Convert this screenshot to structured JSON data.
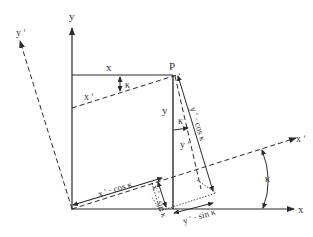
{
  "diagram": {
    "colors": {
      "line": "#2b2b2b",
      "background": "#ffffff"
    },
    "axes": {
      "x": "x",
      "y": "y",
      "x_prime": "x ʹ",
      "y_prime": "y ʹ"
    },
    "point": "P",
    "labels": {
      "x_segment": "x",
      "x_prime_segment": "x ʹ",
      "y_segment": "y",
      "y_prime_segment": "y ʹ",
      "kappa_top": "κ",
      "kappa_mid": "κ",
      "kappa_right": "κ",
      "y_cos": "y ʹ · cos κ",
      "x_cos": "x ʹ · cos κ",
      "x_sin": "x ʹ · sin κ",
      "y_sin": "y ʹ · sin κ"
    }
  }
}
